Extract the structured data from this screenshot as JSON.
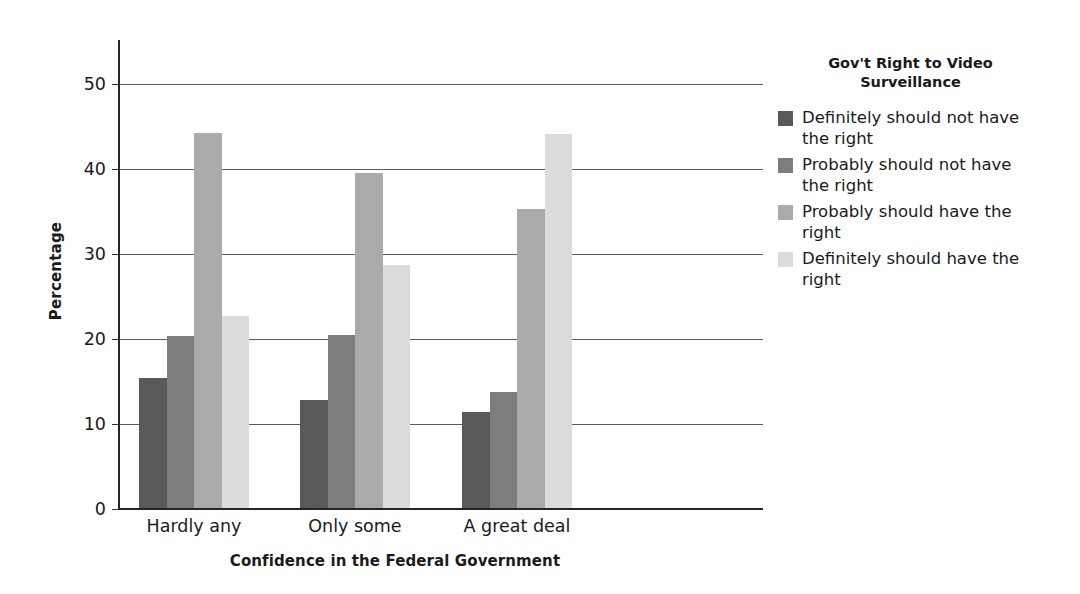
{
  "chart_data": {
    "type": "bar",
    "title": "",
    "xlabel": "Confidence in the Federal Government",
    "ylabel": "Percentage",
    "categories": [
      "Hardly any",
      "Only some",
      "A great deal"
    ],
    "series": [
      {
        "name": "Definitely should not have the right",
        "color": "#595959",
        "values": [
          15.3,
          12.7,
          11.3
        ]
      },
      {
        "name": "Probably should not have the right",
        "color": "#7d7d7d",
        "values": [
          20.2,
          20.3,
          13.6
        ]
      },
      {
        "name": "Probably should have the right",
        "color": "#aaaaaa",
        "values": [
          44.1,
          39.4,
          35.2
        ]
      },
      {
        "name": "Definitely should have the right",
        "color": "#dcdcdc",
        "values": [
          22.6,
          28.6,
          44.0
        ]
      }
    ],
    "ylim": [
      0,
      52
    ],
    "yticks": [
      0,
      10,
      20,
      30,
      40,
      50
    ],
    "ytick_labels": [
      "0",
      "10",
      "20",
      "30",
      "40",
      "50"
    ],
    "grid": "horizontal",
    "legend_position": "right",
    "legend_title": "Gov't Right to Video Surveillance"
  },
  "legend": {
    "title_line1": "Gov't Right to Video",
    "title_line2": "Surveillance",
    "items": [
      {
        "label": "Definitely should not have the right",
        "color": "#595959"
      },
      {
        "label": "Probably should not have the right",
        "color": "#7d7d7d"
      },
      {
        "label": "Probably should have the right",
        "color": "#aaaaaa"
      },
      {
        "label": "Definitely should have the right",
        "color": "#dcdcdc"
      }
    ]
  },
  "axes": {
    "y_title": "Percentage",
    "x_title": "Confidence in the Federal Government"
  }
}
